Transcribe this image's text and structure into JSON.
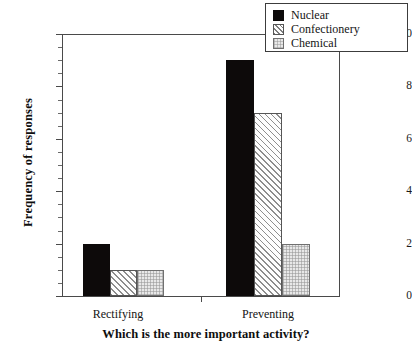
{
  "chart_data": {
    "type": "bar",
    "title": "",
    "xlabel": "Which is the more important activity?",
    "ylabel": "Frequency of responses",
    "categories": [
      "Rectifying",
      "Preventing"
    ],
    "series": [
      {
        "name": "Nuclear",
        "values": [
          2,
          9
        ],
        "pattern": "solid-black",
        "color": "#0d0a0a"
      },
      {
        "name": "Confectionery",
        "values": [
          1,
          7
        ],
        "pattern": "diagonal-hatch",
        "color": "#fdfdfd"
      },
      {
        "name": "Chemical",
        "values": [
          1,
          2
        ],
        "pattern": "gray-stipple",
        "color": "#e8e8e8"
      }
    ],
    "ylim": [
      0,
      10
    ],
    "ytick_labels": [
      "0",
      "2",
      "4",
      "6",
      "8",
      "10"
    ],
    "ytick_values": [
      0,
      2,
      4,
      6,
      8,
      10
    ],
    "yminor_step": 0.5,
    "grid": false,
    "legend_position": "top-right"
  },
  "legend": {
    "items": [
      {
        "label": "Nuclear"
      },
      {
        "label": "Confectionery"
      },
      {
        "label": "Chemical"
      }
    ]
  },
  "axes": {
    "y_title": "Frequency of responses",
    "x_title": "Which is the more important activity?",
    "y_ticks": [
      {
        "label": "10",
        "value": 10
      },
      {
        "label": "8",
        "value": 8
      },
      {
        "label": "6",
        "value": 6
      },
      {
        "label": "4",
        "value": 4
      },
      {
        "label": "2",
        "value": 2
      },
      {
        "label": "0",
        "value": 0
      }
    ],
    "x_ticks": [
      {
        "label": "Rectifying"
      },
      {
        "label": "Preventing"
      }
    ]
  }
}
